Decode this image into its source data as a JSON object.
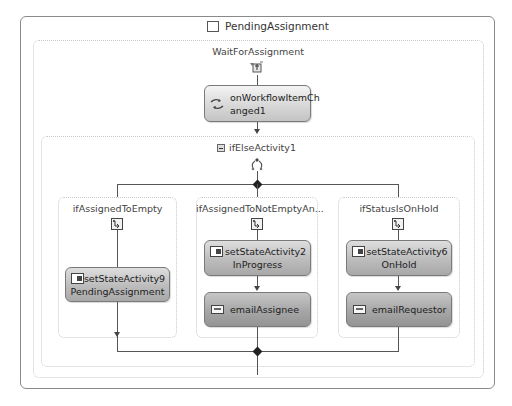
{
  "state": {
    "title": "PendingAssignment",
    "icon": "state-square-icon"
  },
  "event_driven": {
    "label": "WaitForAssignment",
    "icon": "event-driven-icon",
    "activity": {
      "name_line1": "onWorkflowItemCh",
      "name_line2": "anged1",
      "icon": "handle-external-event-icon"
    }
  },
  "if_else": {
    "label": "ifElseActivity1",
    "collapse_icon": "collapse-minus-icon",
    "icon": "if-else-branch-icon",
    "branches": [
      {
        "label": "ifAssignedToEmpty",
        "icon": "branch-condition-icon",
        "activities": [
          {
            "name_line1": "setStateActivity9",
            "name_line2": "PendingAssignment",
            "icon": "set-state-icon"
          }
        ]
      },
      {
        "label": "ifAssignedToNotEmptyAn...",
        "icon": "branch-condition-icon",
        "activities": [
          {
            "name_line1": "setStateActivity2",
            "name_line2": "InProgress",
            "icon": "set-state-icon"
          },
          {
            "name_line1": "emailAssignee",
            "icon": "send-email-icon"
          }
        ]
      },
      {
        "label": "ifStatusIsOnHold",
        "icon": "branch-condition-icon",
        "activities": [
          {
            "name_line1": "setStateActivity6",
            "name_line2": "OnHold",
            "icon": "set-state-icon"
          },
          {
            "name_line1": "emailRequestor",
            "icon": "send-email-icon"
          }
        ]
      }
    ]
  },
  "colors": {
    "border": "#8a8a8a",
    "dotted_border": "#c8c8c8",
    "connector": "#555555",
    "diamond": "#222222"
  }
}
